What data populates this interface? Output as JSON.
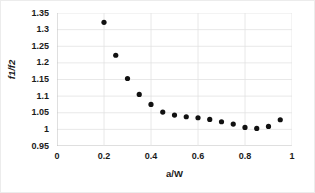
{
  "chart_data": {
    "type": "scatter",
    "title": "",
    "xlabel": "a/W",
    "ylabel": "f1/f2",
    "xlim": [
      0,
      1
    ],
    "ylim": [
      0.95,
      1.35
    ],
    "xticks": [
      "0",
      "0.2",
      "0.4",
      "0.6",
      "0.8",
      "1"
    ],
    "xtick_values": [
      0,
      0.2,
      0.4,
      0.6,
      0.8,
      1
    ],
    "yticks": [
      "0.95",
      "1",
      "1.05",
      "1.1",
      "1.15",
      "1.2",
      "1.25",
      "1.3",
      "1.35"
    ],
    "ytick_values": [
      0.95,
      1,
      1.05,
      1.1,
      1.15,
      1.2,
      1.25,
      1.3,
      1.35
    ],
    "grid": true,
    "legend": false,
    "marker": "filled-circle",
    "marker_color": "#111111",
    "x": [
      0.2,
      0.25,
      0.3,
      0.35,
      0.4,
      0.45,
      0.5,
      0.55,
      0.6,
      0.65,
      0.7,
      0.75,
      0.8,
      0.85,
      0.9,
      0.95
    ],
    "values": [
      1.322,
      1.223,
      1.153,
      1.105,
      1.075,
      1.052,
      1.043,
      1.038,
      1.035,
      1.03,
      1.023,
      1.016,
      1.006,
      1.003,
      1.009,
      1.029
    ],
    "series": [
      {
        "name": "f1/f2",
        "x": [
          0.2,
          0.25,
          0.3,
          0.35,
          0.4,
          0.45,
          0.5,
          0.55,
          0.6,
          0.65,
          0.7,
          0.75,
          0.8,
          0.85,
          0.9,
          0.95
        ],
        "values": [
          1.322,
          1.223,
          1.153,
          1.105,
          1.075,
          1.052,
          1.043,
          1.038,
          1.035,
          1.03,
          1.023,
          1.016,
          1.006,
          1.003,
          1.009,
          1.029
        ]
      }
    ]
  },
  "colors": {
    "marker": "#111111",
    "gridline": "#e2e2e2",
    "axis": "#bfbfbf",
    "text": "#1a1a1a",
    "background": "#ffffff"
  }
}
